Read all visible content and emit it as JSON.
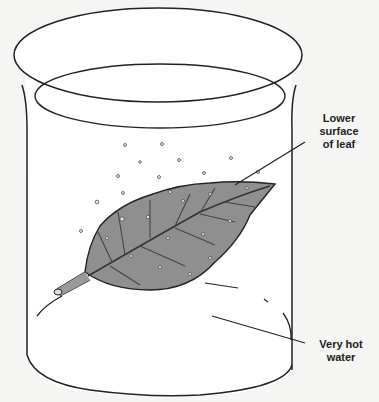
{
  "diagram": {
    "labels": {
      "leaf_line1": "Lower",
      "leaf_line2": "surface",
      "leaf_line3": "of leaf",
      "water_line1": "Very hot",
      "water_line2": "water"
    },
    "colors": {
      "background": "#f5f5f3",
      "outline": "#222222",
      "leaf_fill": "#8f8f8f",
      "water": "#ffffff"
    }
  }
}
